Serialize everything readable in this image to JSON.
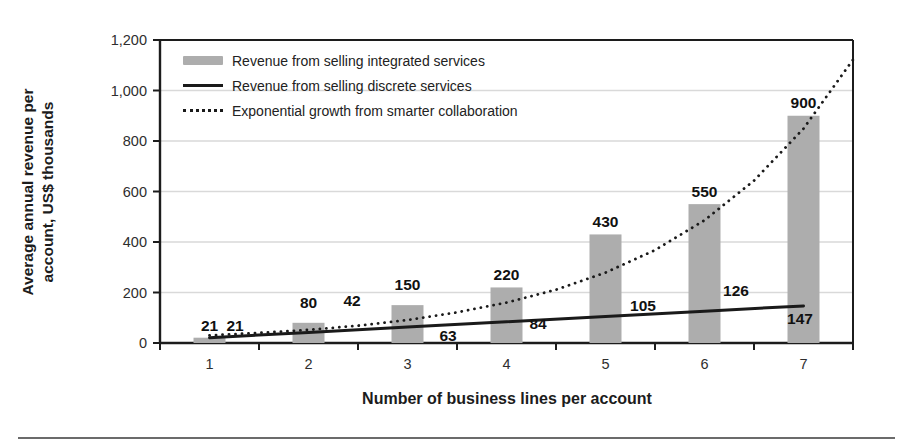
{
  "chart_data": {
    "type": "bar",
    "title": "",
    "xlabel": "Number of business lines per account",
    "ylabel": "Average annual revenue per account, US$ thousands",
    "ylabel_lines": [
      "Average annual revenue per",
      "account, US$ thousands"
    ],
    "categories": [
      "1",
      "2",
      "3",
      "4",
      "5",
      "6",
      "7"
    ],
    "y_tick_labels": [
      "0",
      "200",
      "400",
      "600",
      "800",
      "1,000",
      "1,200"
    ],
    "y_tick_values": [
      0,
      200,
      400,
      600,
      800,
      1000,
      1200
    ],
    "ylim": [
      0,
      1200
    ],
    "grid": "horizontal",
    "legend_position": "top-left-inside",
    "series": [
      {
        "name": "Revenue from selling integrated services",
        "type": "bar",
        "values": [
          21,
          80,
          150,
          220,
          430,
          550,
          900
        ]
      },
      {
        "name": "Revenue from selling discrete services",
        "type": "line",
        "style": "solid",
        "values": [
          21,
          42,
          63,
          84,
          105,
          126,
          147
        ]
      },
      {
        "name": "Exponential growth from smarter collaboration",
        "type": "line",
        "style": "dotted",
        "estimated": true,
        "x": [
          1,
          1.5,
          2,
          2.5,
          3,
          3.5,
          4,
          4.5,
          5,
          5.5,
          6,
          6.5,
          7,
          7.5
        ],
        "values": [
          30,
          40,
          52,
          69,
          91,
          121,
          160,
          211,
          279,
          368,
          486,
          643,
          849,
          1122
        ]
      }
    ],
    "colors": {
      "bar": "#adadad",
      "line": "#1a1a1a",
      "grid": "#d9d9d9",
      "frame": "#1c1c1c",
      "tick_text": "#2e2e2e",
      "value_text": "#111111",
      "background": "#ffffff",
      "divider": "#6b6b6b"
    }
  }
}
